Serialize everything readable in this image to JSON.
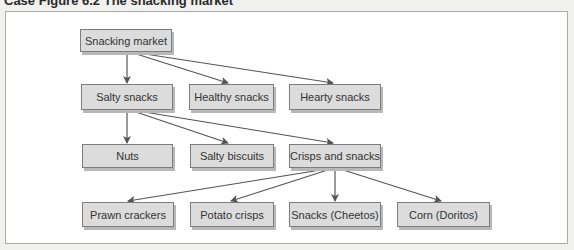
{
  "caption": "Case Figure 6.2 The snacking market",
  "colors": {
    "node_fill": "#dcdcdc",
    "node_border": "#7d7d7d",
    "arrow": "#555555",
    "frame_border": "#a9a9a9"
  },
  "nodes": {
    "snacking_market": "Snacking market",
    "salty_snacks": "Salty snacks",
    "healthy_snacks": "Healthy snacks",
    "hearty_snacks": "Hearty snacks",
    "nuts": "Nuts",
    "salty_biscuits": "Salty biscuits",
    "crisps_and_snacks": "Crisps and snacks",
    "prawn_crackers": "Prawn crackers",
    "potato_crisps": "Potato crisps",
    "snacks_cheetos": "Snacks (Cheetos)",
    "corn_doritos": "Corn (Doritos)"
  },
  "edges": [
    {
      "from": "Snacking market",
      "to": "Salty snacks"
    },
    {
      "from": "Snacking market",
      "to": "Healthy snacks"
    },
    {
      "from": "Snacking market",
      "to": "Hearty snacks"
    },
    {
      "from": "Salty snacks",
      "to": "Nuts"
    },
    {
      "from": "Salty snacks",
      "to": "Salty biscuits"
    },
    {
      "from": "Salty snacks",
      "to": "Crisps and snacks"
    },
    {
      "from": "Crisps and snacks",
      "to": "Prawn crackers"
    },
    {
      "from": "Crisps and snacks",
      "to": "Potato crisps"
    },
    {
      "from": "Crisps and snacks",
      "to": "Snacks (Cheetos)"
    },
    {
      "from": "Crisps and snacks",
      "to": "Corn (Doritos)"
    }
  ]
}
